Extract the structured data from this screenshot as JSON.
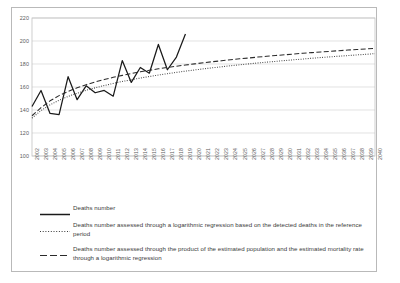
{
  "chart_data": {
    "type": "line",
    "title": "",
    "xlabel": "",
    "ylabel": "",
    "ylim": [
      100,
      220
    ],
    "yticks": [
      100,
      120,
      140,
      160,
      180,
      200,
      220
    ],
    "grid": true,
    "legend_position": "bottom-left",
    "categories": [
      "2002",
      "2003",
      "2004",
      "2005",
      "2006",
      "2007",
      "2008",
      "2009",
      "2010",
      "2011",
      "2012",
      "2013",
      "2014",
      "2015",
      "2016",
      "2017",
      "2018",
      "2019",
      "2020",
      "2021",
      "2022",
      "2023",
      "2024",
      "2025",
      "2026",
      "2027",
      "2028",
      "2029",
      "2030",
      "2031",
      "2032",
      "2033",
      "2034",
      "2035",
      "2036",
      "2037",
      "2038",
      "2039",
      "2040"
    ],
    "series": [
      {
        "name": "Deaths number",
        "style": "solid",
        "color": "#1a1a1a",
        "x": [
          "2002",
          "2003",
          "2004",
          "2005",
          "2006",
          "2007",
          "2008",
          "2009",
          "2010",
          "2011",
          "2012",
          "2013",
          "2014",
          "2015",
          "2016",
          "2017",
          "2018",
          "2019"
        ],
        "values": [
          143,
          157,
          137,
          136,
          169,
          149,
          161,
          155,
          157,
          152,
          183,
          164,
          177,
          172,
          197,
          175,
          186,
          206
        ]
      },
      {
        "name": "Deaths number assessed through a logarithmic regression based on the detected deaths in the reference period",
        "style": "dotted",
        "color": "#3a3a3a",
        "x": [
          "2002",
          "2003",
          "2004",
          "2005",
          "2006",
          "2007",
          "2008",
          "2009",
          "2010",
          "2011",
          "2012",
          "2013",
          "2014",
          "2015",
          "2016",
          "2017",
          "2018",
          "2019",
          "2020",
          "2021",
          "2022",
          "2023",
          "2024",
          "2025",
          "2026",
          "2027",
          "2028",
          "2029",
          "2030",
          "2031",
          "2032",
          "2033",
          "2034",
          "2035",
          "2036",
          "2037",
          "2038",
          "2039",
          "2040"
        ],
        "values": [
          133,
          139.5,
          144.5,
          148.5,
          151.8,
          154.6,
          157.1,
          159.3,
          161.3,
          163.1,
          164.8,
          166.3,
          167.8,
          169.1,
          170.4,
          171.6,
          172.7,
          173.8,
          174.8,
          175.8,
          176.7,
          177.6,
          178.5,
          179.3,
          180.1,
          180.9,
          181.6,
          182.3,
          183.0,
          183.7,
          184.3,
          185.0,
          185.6,
          186.2,
          186.8,
          187.3,
          187.9,
          188.4,
          189.0
        ]
      },
      {
        "name": "Deaths number assessed through the product of the estimated population and the estimated mortality rate through a logarithmic regression",
        "style": "dashed",
        "color": "#2b2b2b",
        "x": [
          "2002",
          "2003",
          "2004",
          "2005",
          "2006",
          "2007",
          "2008",
          "2009",
          "2010",
          "2011",
          "2012",
          "2013",
          "2014",
          "2015",
          "2016",
          "2017",
          "2018",
          "2019",
          "2020",
          "2021",
          "2022",
          "2023",
          "2024",
          "2025",
          "2026",
          "2027",
          "2028",
          "2029",
          "2030",
          "2031",
          "2032",
          "2033",
          "2034",
          "2035",
          "2036",
          "2037",
          "2038",
          "2039",
          "2040"
        ],
        "values": [
          135,
          142,
          148,
          152.5,
          156.2,
          159.3,
          162.0,
          164.4,
          166.5,
          168.4,
          170.1,
          171.7,
          173.2,
          174.5,
          175.8,
          177.0,
          178.1,
          179.1,
          180.1,
          181.1,
          182.0,
          182.8,
          183.7,
          184.5,
          185.2,
          186.0,
          186.7,
          187.4,
          188.0,
          188.7,
          189.3,
          189.9,
          190.5,
          191.0,
          191.6,
          192.1,
          192.6,
          193.1,
          193.6
        ]
      }
    ]
  },
  "legend": {
    "items": [
      {
        "label": "Deaths number",
        "style": "solid"
      },
      {
        "label": "Deaths number assessed through a logarithmic regression based on the detected deaths in the reference period",
        "style": "dotted"
      },
      {
        "label": "Deaths number assessed through the product of the estimated population and the estimated mortality rate through a logarithmic regression",
        "style": "dashed"
      }
    ]
  }
}
